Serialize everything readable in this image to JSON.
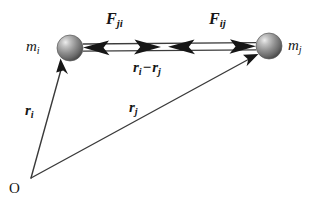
{
  "figure": {
    "background_color": "#ffffff",
    "ink_color": "#161616",
    "width": 323,
    "height": 204
  },
  "labels": {
    "force_on_i": {
      "symbol": "F",
      "subscript": "ji"
    },
    "force_on_j": {
      "symbol": "F",
      "subscript": "ij"
    },
    "separation": {
      "first_symbol": "r",
      "first_subscript": "i",
      "operator": "−",
      "second_symbol": "r",
      "second_subscript": "j"
    },
    "mass_i": {
      "symbol": "m",
      "subscript": "i"
    },
    "mass_j": {
      "symbol": "m",
      "subscript": "j"
    },
    "position_i": {
      "symbol": "r",
      "subscript": "i"
    },
    "position_j": {
      "symbol": "r",
      "subscript": "j"
    },
    "origin": "O"
  },
  "geometry": {
    "origin_point": {
      "x": 31,
      "y": 178
    },
    "mass_i_center": {
      "x": 70,
      "y": 48,
      "radius": 13
    },
    "mass_j_center": {
      "x": 269,
      "y": 46,
      "radius": 13
    },
    "sphere_fill": "#8d8d8d",
    "sphere_highlight": "#e8e8e8",
    "sphere_shadow": "#4c4c4c"
  }
}
